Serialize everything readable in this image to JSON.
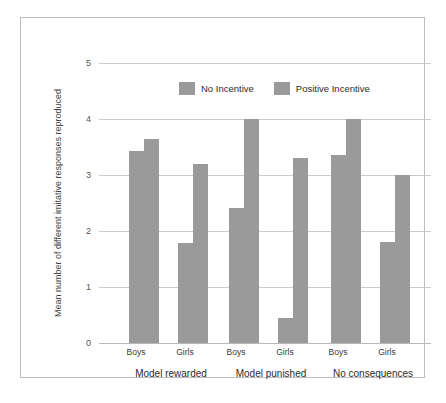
{
  "chart_data": {
    "type": "bar",
    "title": "",
    "subtitle": "",
    "xlabel": "",
    "ylabel": "Mean number of different imitative responses reproduced",
    "ylim": [
      0,
      5
    ],
    "yticks": [
      "0",
      "1",
      "2",
      "3",
      "4",
      "5"
    ],
    "grid": true,
    "legend_position": "top-center",
    "categories": [
      "Model rewarded - Boys",
      "Model rewarded - Girls",
      "Model punished - Boys",
      "Model punished - Girls",
      "No consequences - Boys",
      "No consequences - Girls"
    ],
    "groups": [
      {
        "label": "Model rewarded",
        "subgroups": [
          {
            "label": "Boys",
            "no_incentive": 3.43,
            "positive_incentive": 3.64
          },
          {
            "label": "Girls",
            "no_incentive": 1.79,
            "positive_incentive": 3.2
          }
        ]
      },
      {
        "label": "Model punished",
        "subgroups": [
          {
            "label": "Boys",
            "no_incentive": 2.41,
            "positive_incentive": 4.0
          },
          {
            "label": "Girls",
            "no_incentive": 0.45,
            "positive_incentive": 3.3
          }
        ]
      },
      {
        "label": "No consequences",
        "subgroups": [
          {
            "label": "Boys",
            "no_incentive": 3.36,
            "positive_incentive": 4.0
          },
          {
            "label": "Girls",
            "no_incentive": 1.81,
            "positive_incentive": 3.0
          }
        ]
      }
    ],
    "series": [
      {
        "name": "No Incentive",
        "color": "#9a9a9a",
        "values": [
          3.43,
          1.79,
          2.41,
          0.45,
          3.36,
          1.81
        ]
      },
      {
        "name": "Positive Incentive",
        "color": "#9a9a9a",
        "values": [
          3.64,
          3.2,
          4.0,
          3.3,
          4.0,
          3.0
        ]
      }
    ]
  },
  "legend": {
    "entries": [
      {
        "label": "No Incentive",
        "color": "#9a9a9a",
        "swatch_name": "legend-swatch-no-incentive"
      },
      {
        "label": "Positive Incentive",
        "color": "#9a9a9a",
        "swatch_name": "legend-swatch-positive-incentive"
      }
    ]
  },
  "axis": {
    "y_title": "Mean number of different imitative responses reproduced",
    "y_tick_labels": [
      "5",
      "4",
      "3",
      "2",
      "1",
      "0"
    ]
  },
  "colors": {
    "bar": "#9a9a9a",
    "gridline": "#cbcbcb",
    "baseline": "#b9b9b9",
    "frame": "#bdbdbd",
    "background": "#ffffff",
    "tick_text": "#555555",
    "label_text": "#2b2b2b"
  }
}
